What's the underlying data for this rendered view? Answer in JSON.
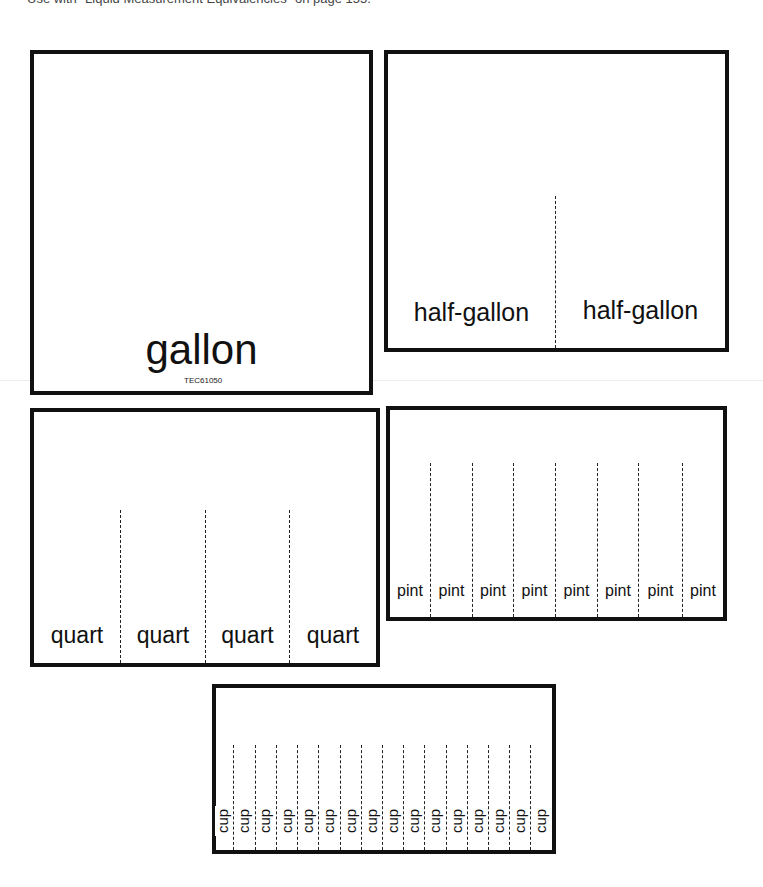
{
  "header": {
    "instruction": "Use with \"Liquid Measurement Equivalencies\" on page 155."
  },
  "cards": {
    "gallon": {
      "label": "gallon",
      "code": "TEC61050"
    },
    "half_gallon": {
      "labels": [
        "half-gallon",
        "half-gallon"
      ]
    },
    "quart": {
      "labels": [
        "quart",
        "quart",
        "quart",
        "quart"
      ]
    },
    "pint": {
      "labels": [
        "pint",
        "pint",
        "pint",
        "pint",
        "pint",
        "pint",
        "pint",
        "pint"
      ]
    },
    "cup": {
      "labels": [
        "cup",
        "cup",
        "cup",
        "cup",
        "cup",
        "cup",
        "cup",
        "cup",
        "cup",
        "cup",
        "cup",
        "cup",
        "cup",
        "cup",
        "cup",
        "cup"
      ]
    }
  },
  "colors": {
    "border": "#111111",
    "background": "#ffffff"
  }
}
